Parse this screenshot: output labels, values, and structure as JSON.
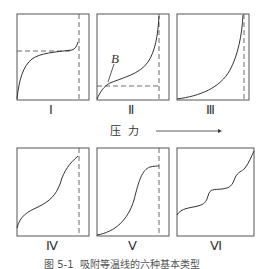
{
  "figure": {
    "axis_label": "压  力",
    "axis_arrow": "pressure-arrow-right",
    "caption": "图 5-1  吸附等温线的六种基本类型",
    "line_color": "#333333",
    "dash_color": "#444444"
  },
  "panels": [
    {
      "id": "I",
      "label": "Ⅰ"
    },
    {
      "id": "II",
      "label": "Ⅱ",
      "annotation": "B"
    },
    {
      "id": "III",
      "label": "Ⅲ"
    },
    {
      "id": "IV",
      "label": "Ⅳ"
    },
    {
      "id": "V",
      "label": "Ⅴ"
    },
    {
      "id": "VI",
      "label": "Ⅵ"
    }
  ]
}
